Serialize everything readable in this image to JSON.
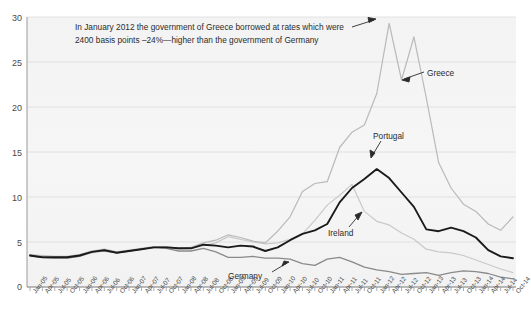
{
  "top_caption": "",
  "annotation": {
    "line1": "In January 2012 the government of Greece borrowed at rates which were",
    "line2": "2400 basis points –24%—higher than the government of Germany"
  },
  "labels": {
    "greece": "Greece",
    "portugal": "Portugal",
    "ireland": "Ireland",
    "germany": "Germany"
  },
  "colors": {
    "greece": "#b9b9b9",
    "portugal": "#1a1a1a",
    "ireland": "#c9c9c9",
    "germany": "#8a8a8a",
    "plot_bg": "#f3f3f3",
    "grid": "#dcdcdc",
    "axis": "#9a9a9a"
  },
  "chart_data": {
    "type": "line",
    "title": "",
    "xlabel": "",
    "ylabel": "",
    "ylim": [
      0,
      30
    ],
    "yticks": [
      0,
      5,
      10,
      15,
      20,
      25,
      30
    ],
    "grid": true,
    "legend": "inline-annotations",
    "categories": [
      "Jan-05",
      "Apr-05",
      "Jul-05",
      "Oct-05",
      "Jan-06",
      "Apr-06",
      "Jul-06",
      "Oct-06",
      "Jan-07",
      "Apr-07",
      "Jul-07",
      "Oct-07",
      "Jan-08",
      "Apr-08",
      "Jul-08",
      "Oct-08",
      "Jan-09",
      "Apr-09",
      "Jul-09",
      "Oct-09",
      "Jan-10",
      "Apr-10",
      "Jul-10",
      "Oct-10",
      "Jan-11",
      "Apr-11",
      "Jul-11",
      "Oct-11",
      "Jan-12",
      "Apr-12",
      "Jul-12",
      "Oct-12",
      "Jan-13",
      "Apr-13",
      "Jul-13",
      "Oct-13",
      "Jan-14",
      "Apr-14",
      "Jul-14",
      "Oct-14"
    ],
    "x_monthly_start": "Jan-05",
    "x_monthly_end": "Oct-14",
    "series": [
      {
        "name": "Greece",
        "color": "#b9b9b9",
        "values": [
          3.6,
          3.5,
          3.4,
          3.4,
          3.6,
          4.0,
          4.2,
          3.9,
          4.1,
          4.3,
          4.5,
          4.5,
          4.3,
          4.4,
          4.9,
          5.2,
          5.8,
          5.5,
          5.1,
          4.9,
          6.2,
          7.8,
          10.6,
          11.5,
          11.7,
          15.5,
          17.2,
          18.0,
          21.5,
          29.3,
          23.0,
          27.8,
          21.0,
          13.8,
          11.0,
          9.2,
          8.4,
          7.0,
          6.3,
          7.8
        ]
      },
      {
        "name": "Portugal",
        "color": "#1a1a1a",
        "values": [
          3.5,
          3.3,
          3.3,
          3.3,
          3.5,
          3.9,
          4.1,
          3.8,
          4.0,
          4.2,
          4.4,
          4.4,
          4.3,
          4.3,
          4.7,
          4.6,
          4.4,
          4.6,
          4.5,
          4.0,
          4.4,
          5.2,
          5.9,
          6.3,
          7.0,
          9.4,
          11.0,
          12.0,
          13.1,
          12.1,
          10.5,
          8.9,
          6.4,
          6.2,
          6.6,
          6.2,
          5.5,
          4.1,
          3.4,
          3.2
        ]
      },
      {
        "name": "Ireland",
        "color": "#c9c9c9",
        "values": [
          3.4,
          3.3,
          3.2,
          3.2,
          3.4,
          3.8,
          4.0,
          3.8,
          4.0,
          4.2,
          4.4,
          4.4,
          4.2,
          4.3,
          4.6,
          4.9,
          5.6,
          5.3,
          5.0,
          4.8,
          4.9,
          5.3,
          5.9,
          7.4,
          9.1,
          10.2,
          11.4,
          8.4,
          7.3,
          6.9,
          6.0,
          5.3,
          4.2,
          3.9,
          3.8,
          3.5,
          3.0,
          2.5,
          2.0,
          1.6
        ]
      },
      {
        "name": "Germany",
        "color": "#8a8a8a",
        "values": [
          3.5,
          3.3,
          3.2,
          3.2,
          3.4,
          3.9,
          4.0,
          3.8,
          4.0,
          4.2,
          4.4,
          4.3,
          4.0,
          4.0,
          4.3,
          3.9,
          3.3,
          3.3,
          3.4,
          3.2,
          3.2,
          3.1,
          2.6,
          2.4,
          3.1,
          3.3,
          2.8,
          2.2,
          1.9,
          1.7,
          1.4,
          1.5,
          1.6,
          1.3,
          1.6,
          1.8,
          1.7,
          1.5,
          1.1,
          0.9
        ]
      }
    ],
    "annotations": [
      {
        "text": "In January 2012 the government of Greece borrowed at rates which were 2400 basis points –24%—higher than the government of Germany",
        "target": "Greece peak"
      }
    ]
  }
}
